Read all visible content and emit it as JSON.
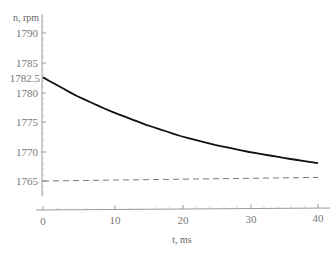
{
  "chart_data": {
    "type": "line",
    "title": "",
    "xlabel": "t, ms",
    "ylabel": "n, rpm",
    "xlim": [
      0,
      40
    ],
    "ylim": [
      1763,
      1792
    ],
    "x_ticks": [
      "0",
      "10",
      "20",
      "30",
      "40"
    ],
    "y_ticks": [
      "1765",
      "1770",
      "1775",
      "1780",
      "1782.5",
      "1785",
      "1790"
    ],
    "grid": false,
    "legend": null,
    "series": [
      {
        "name": "speed",
        "style": "solid",
        "color": "#111111",
        "x": [
          0,
          5,
          10,
          15,
          20,
          25,
          30,
          35,
          40
        ],
        "y": [
          1782.5,
          1779.3,
          1776.7,
          1774.5,
          1772.6,
          1771.1,
          1769.9,
          1768.9,
          1768.0
        ]
      },
      {
        "name": "reference",
        "style": "dashed",
        "color": "#777777",
        "x": [
          0,
          40
        ],
        "y": [
          1765.0,
          1765.6
        ]
      }
    ]
  },
  "labels": {
    "y_axis_title": "n, rpm",
    "x_axis_title": "t, ms",
    "x_tick_0": "0",
    "x_tick_10": "10",
    "x_tick_20": "20",
    "x_tick_30": "30",
    "x_tick_40": "40",
    "y_tick_1790": "1790",
    "y_tick_1785": "1785",
    "y_tick_1782_5": "1782.5",
    "y_tick_1780": "1780",
    "y_tick_1775": "1775",
    "y_tick_1770": "1770",
    "y_tick_1765": "1765"
  }
}
